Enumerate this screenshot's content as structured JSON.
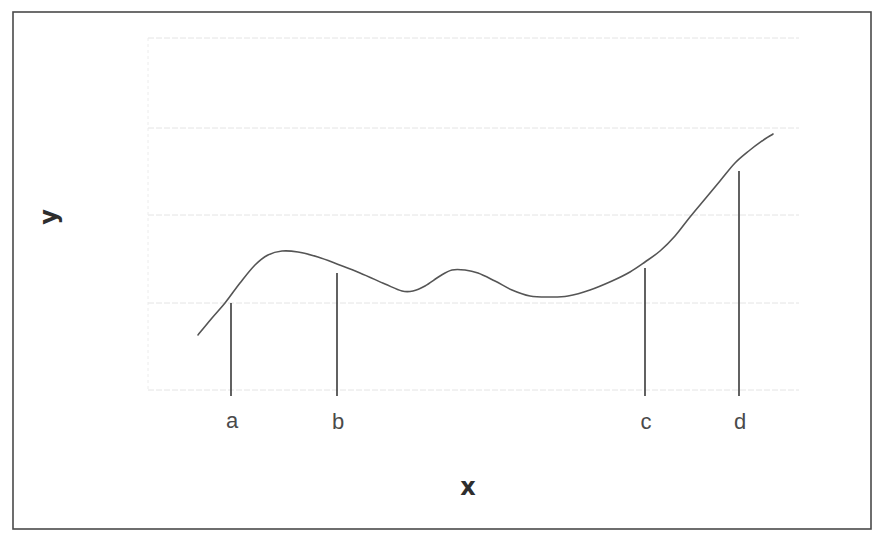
{
  "diagram": {
    "title": "",
    "x_axis_label": "x",
    "y_axis_label": "y",
    "colors": {
      "frame": "#4a4a4a",
      "curve": "#555555",
      "marker_line": "#3a3a3a",
      "gridline": "#e4e4e4",
      "text": "#4a4a4a"
    },
    "frame": {
      "x": 13,
      "y": 12,
      "width": 858,
      "height": 517
    },
    "plot_area": {
      "left": 148,
      "top": 38,
      "right": 799,
      "bottom": 390
    },
    "gridlines_y": [
      38,
      128,
      215,
      303,
      390
    ],
    "curve_points": [
      [
        198,
        335
      ],
      [
        212,
        318
      ],
      [
        225,
        303
      ],
      [
        240,
        283
      ],
      [
        255,
        265
      ],
      [
        268,
        255
      ],
      [
        282,
        251
      ],
      [
        298,
        252
      ],
      [
        318,
        257
      ],
      [
        337,
        264
      ],
      [
        360,
        273
      ],
      [
        385,
        284
      ],
      [
        402,
        291
      ],
      [
        413,
        291
      ],
      [
        425,
        286
      ],
      [
        440,
        276
      ],
      [
        452,
        270
      ],
      [
        465,
        270
      ],
      [
        478,
        273
      ],
      [
        495,
        281
      ],
      [
        512,
        290
      ],
      [
        530,
        296
      ],
      [
        550,
        297
      ],
      [
        568,
        296
      ],
      [
        590,
        290
      ],
      [
        612,
        281
      ],
      [
        630,
        272
      ],
      [
        645,
        262
      ],
      [
        660,
        251
      ],
      [
        675,
        236
      ],
      [
        690,
        217
      ],
      [
        705,
        199
      ],
      [
        720,
        181
      ],
      [
        735,
        163
      ],
      [
        750,
        150
      ],
      [
        762,
        141
      ],
      [
        773,
        134
      ]
    ],
    "markers": [
      {
        "label": "a",
        "x": 231,
        "y_top": 303,
        "y_bottom": 396,
        "label_y": 422
      },
      {
        "label": "b",
        "x": 337,
        "y_top": 273,
        "y_bottom": 396,
        "label_y": 423
      },
      {
        "label": "c",
        "x": 645,
        "y_top": 268,
        "y_bottom": 396,
        "label_y": 423
      },
      {
        "label": "d",
        "x": 739,
        "y_top": 171,
        "y_bottom": 396,
        "label_y": 423
      }
    ],
    "x_label_pos": {
      "x": 468,
      "y": 488
    },
    "y_label_pos": {
      "x": 50,
      "y": 217
    }
  }
}
